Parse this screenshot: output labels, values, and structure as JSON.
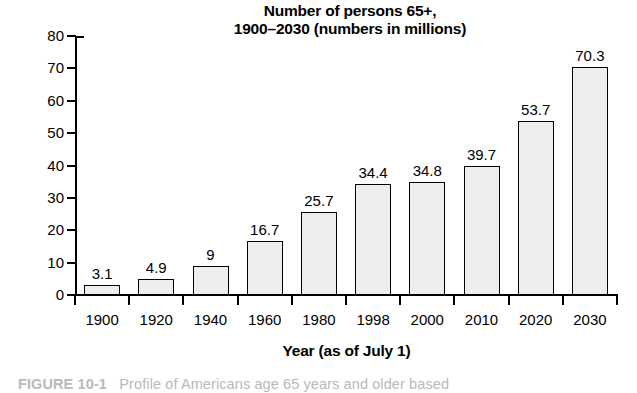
{
  "chart_data": {
    "type": "bar",
    "title": "Number of persons 65+, 1900–2030 (numbers in millions)",
    "title_line1": "Number of persons 65+,",
    "title_line2": "1900–2030 (numbers in millions)",
    "xlabel": "Year (as of July 1)",
    "ylabel": "",
    "ylim": [
      0,
      80
    ],
    "ytick_step": 10,
    "grid": false,
    "legend": false,
    "bar_fill_color": "#eeeeee",
    "bar_edge_color": "#000000",
    "categories": [
      "1900",
      "1920",
      "1940",
      "1960",
      "1980",
      "1998",
      "2000",
      "2010",
      "2020",
      "2030"
    ],
    "values": [
      3.1,
      4.9,
      9,
      16.7,
      25.7,
      34.4,
      34.8,
      39.7,
      53.7,
      70.3
    ],
    "value_labels": [
      "3.1",
      "4.9",
      "9",
      "16.7",
      "25.7",
      "34.4",
      "34.8",
      "39.7",
      "53.7",
      "70.3"
    ],
    "ytick_labels": [
      "80",
      "70",
      "60",
      "50",
      "40",
      "30",
      "20",
      "10",
      "0"
    ],
    "ytick_values": [
      80,
      70,
      60,
      50,
      40,
      30,
      20,
      10,
      0
    ]
  },
  "caption": {
    "number": "FIGURE 10-1",
    "text": "Profile of Americans age 65 years and older based"
  }
}
